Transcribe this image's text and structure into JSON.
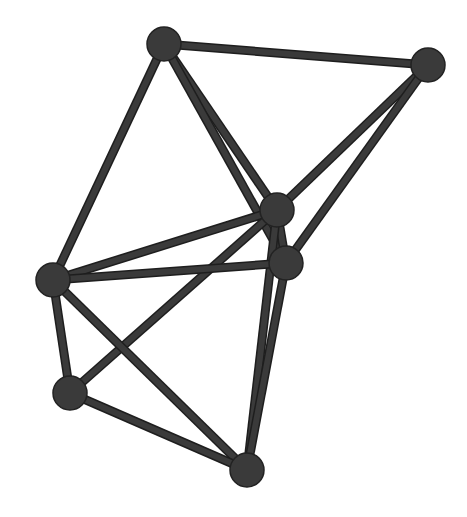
{
  "diagram": {
    "type": "network-graph",
    "node_color": "#3a3a3a",
    "node_stroke": "#222222",
    "edge_color": "#3a3a3a",
    "edge_outline": "#1e1e1e",
    "node_radius": 17,
    "nodes": [
      {
        "id": "A",
        "x": 164,
        "y": 44
      },
      {
        "id": "B",
        "x": 428,
        "y": 65
      },
      {
        "id": "C",
        "x": 277,
        "y": 210
      },
      {
        "id": "D",
        "x": 286,
        "y": 263
      },
      {
        "id": "E",
        "x": 53,
        "y": 280
      },
      {
        "id": "F",
        "x": 70,
        "y": 393
      },
      {
        "id": "G",
        "x": 247,
        "y": 470
      }
    ],
    "edges": [
      [
        "A",
        "B"
      ],
      [
        "A",
        "C"
      ],
      [
        "A",
        "D"
      ],
      [
        "A",
        "E"
      ],
      [
        "B",
        "C"
      ],
      [
        "B",
        "D"
      ],
      [
        "C",
        "D"
      ],
      [
        "C",
        "E"
      ],
      [
        "C",
        "F"
      ],
      [
        "C",
        "G"
      ],
      [
        "D",
        "E"
      ],
      [
        "D",
        "G"
      ],
      [
        "E",
        "F"
      ],
      [
        "E",
        "G"
      ],
      [
        "F",
        "G"
      ]
    ]
  }
}
